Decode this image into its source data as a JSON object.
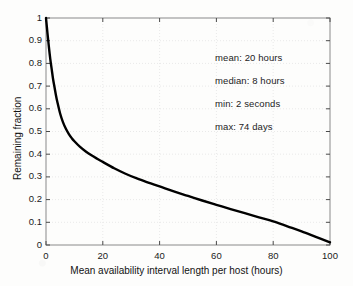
{
  "chart_data": {
    "type": "line",
    "title": "",
    "subtitle": "",
    "xlabel": "Mean availability interval length per host (hours)",
    "ylabel": "Remaining fraction",
    "xlim": [
      0,
      100
    ],
    "ylim": [
      0,
      1
    ],
    "xticks": [
      "0",
      "20",
      "40",
      "60",
      "80",
      "100"
    ],
    "xtick_values": [
      0,
      20,
      40,
      60,
      80,
      100
    ],
    "yticks": [
      "0",
      "0.1",
      "0.2",
      "0.3",
      "0.4",
      "0.5",
      "0.6",
      "0.7",
      "0.8",
      "0.9",
      "1"
    ],
    "ytick_values": [
      0,
      0.1,
      0.2,
      0.3,
      0.4,
      0.5,
      0.6,
      0.7,
      0.8,
      0.9,
      1
    ],
    "grid": true,
    "grid_style": "dotted-light-gray",
    "legend": null,
    "legend_position": "none",
    "line_color": "#000000",
    "line_width": 2.4,
    "series": [
      {
        "name": "Remaining fraction",
        "x": [
          0,
          0.5,
          1,
          1.5,
          2,
          2.5,
          3,
          3.5,
          4,
          5,
          6,
          7,
          8,
          9,
          10,
          12,
          14,
          16,
          18,
          20,
          24,
          28,
          32,
          36,
          40,
          45,
          50,
          55,
          60,
          65,
          70,
          75,
          80,
          85,
          90,
          95,
          100
        ],
        "y": [
          1.0,
          0.935,
          0.875,
          0.82,
          0.775,
          0.73,
          0.695,
          0.66,
          0.63,
          0.578,
          0.54,
          0.512,
          0.49,
          0.472,
          0.457,
          0.432,
          0.412,
          0.395,
          0.38,
          0.366,
          0.338,
          0.314,
          0.293,
          0.275,
          0.258,
          0.236,
          0.216,
          0.196,
          0.177,
          0.158,
          0.14,
          0.122,
          0.104,
          0.082,
          0.06,
          0.036,
          0.012
        ]
      }
    ],
    "annotations": [
      {
        "name": "mean",
        "text": "mean: 20 hours"
      },
      {
        "name": "median",
        "text": "median: 8 hours"
      },
      {
        "name": "min",
        "text": "min: 2 seconds"
      },
      {
        "name": "max",
        "text": "max: 74 days"
      }
    ]
  },
  "axes_geometry": {
    "left_px": 46,
    "right_px": 330,
    "top_px": 18,
    "bottom_px": 245
  }
}
